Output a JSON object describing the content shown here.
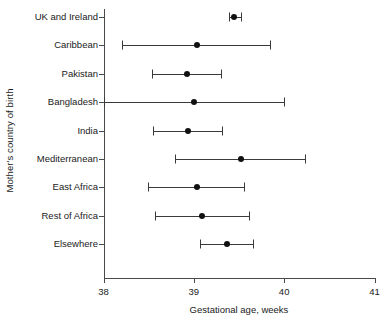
{
  "chart_data": {
    "type": "scatter",
    "title": "",
    "xlabel": "Gestational age, weeks",
    "ylabel": "Mother's country of birth",
    "xlim": [
      38,
      41
    ],
    "xticks": [
      38,
      39,
      40,
      41
    ],
    "xtick_labels": [
      "38",
      "39",
      "40",
      "41"
    ],
    "grid": false,
    "legend": "none",
    "orientation": "horizontal",
    "marker": "filled-circle",
    "error_bars": "horizontal-capped",
    "categories": [
      "UK and Ireland",
      "Caribbean",
      "Pakistan",
      "Bangladesh",
      "India",
      "Mediterranean",
      "East Africa",
      "Rest of Africa",
      "Elsewhere"
    ],
    "values": [
      39.45,
      39.03,
      38.92,
      39.0,
      38.93,
      39.52,
      39.03,
      39.09,
      39.37
    ],
    "ci_low": [
      39.39,
      38.21,
      38.54,
      38.0,
      38.55,
      38.79,
      38.49,
      38.57,
      39.07
    ],
    "ci_high": [
      39.52,
      39.84,
      39.3,
      40.0,
      39.31,
      40.23,
      39.55,
      39.61,
      39.66
    ],
    "points": [
      {
        "category": "UK and Ireland",
        "value": 39.45,
        "ci_low": 39.39,
        "ci_high": 39.52
      },
      {
        "category": "Caribbean",
        "value": 39.03,
        "ci_low": 38.21,
        "ci_high": 39.84
      },
      {
        "category": "Pakistan",
        "value": 38.92,
        "ci_low": 38.54,
        "ci_high": 39.3
      },
      {
        "category": "Bangladesh",
        "value": 39.0,
        "ci_low": 38.0,
        "ci_high": 40.0
      },
      {
        "category": "India",
        "value": 38.93,
        "ci_low": 38.55,
        "ci_high": 39.31
      },
      {
        "category": "Mediterranean",
        "value": 39.52,
        "ci_low": 38.79,
        "ci_high": 40.23
      },
      {
        "category": "East Africa",
        "value": 39.03,
        "ci_low": 38.49,
        "ci_high": 39.55
      },
      {
        "category": "Rest of Africa",
        "value": 39.09,
        "ci_low": 38.57,
        "ci_high": 39.61
      },
      {
        "category": "Elsewhere",
        "value": 39.37,
        "ci_low": 39.07,
        "ci_high": 39.66
      }
    ],
    "colors": {
      "marker": "#111111",
      "line": "#3a3a3a",
      "axis": "#4a4a4a",
      "text": "#1a1a1a",
      "background": "#ffffff"
    }
  }
}
